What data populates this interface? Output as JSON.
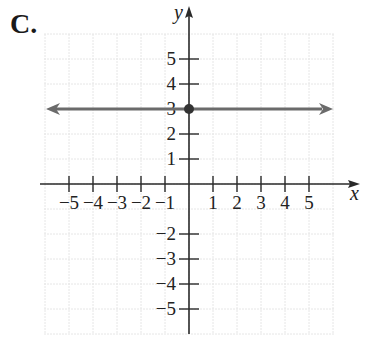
{
  "figure_label": "C.",
  "chart_data": {
    "type": "line",
    "title": "",
    "xlabel": "x",
    "ylabel": "y",
    "xlim": [
      -6,
      6
    ],
    "ylim": [
      -6,
      6
    ],
    "grid": true,
    "x_ticks": [
      -5,
      -4,
      -3,
      -2,
      -1,
      1,
      2,
      3,
      4,
      5
    ],
    "y_ticks": [
      -5,
      -4,
      -3,
      -2,
      1,
      2,
      3,
      4,
      5
    ],
    "x_tick_labels": [
      "−5",
      "−4",
      "−3",
      "−2",
      "−1",
      "1",
      "2",
      "3",
      "4",
      "5"
    ],
    "y_tick_labels": [
      "−5",
      "−4",
      "−3",
      "−2",
      "1",
      "2",
      "3",
      "4",
      "5"
    ],
    "series": [
      {
        "name": "y = 3",
        "kind": "horizontal-line",
        "equation": "y = 3",
        "y": 3,
        "arrows": "both",
        "color": "#6b6b6b"
      }
    ],
    "points": [
      {
        "x": 0,
        "y": 3,
        "label": "y-intercept",
        "color": "#333333"
      }
    ]
  },
  "colors": {
    "axis": "#2a2a2a",
    "grid": "#e6e6e6",
    "line": "#6b6b6b",
    "point": "#333333"
  }
}
